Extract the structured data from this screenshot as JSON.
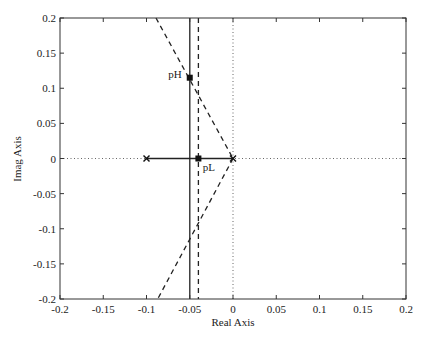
{
  "chart_data": {
    "type": "line",
    "subtype": "root-locus",
    "title": "",
    "xlabel": "Real  Axis",
    "ylabel": "Imag  Axis",
    "xlim": [
      -0.2,
      0.2
    ],
    "ylim": [
      -0.2,
      0.2
    ],
    "xticks": [
      -0.2,
      -0.15,
      -0.1,
      -0.05,
      0,
      0.05,
      0.1,
      0.15,
      0.2
    ],
    "xtick_labels": [
      "-0.2",
      "-0.15",
      "-0.1",
      "-0.05",
      "0",
      "0.05",
      "0.1",
      "0.15",
      "0.2"
    ],
    "yticks": [
      0.2,
      0.15,
      0.1,
      0.05,
      0,
      -0.05,
      -0.1,
      -0.15,
      -0.2
    ],
    "ytick_labels": [
      "0.2",
      "0.15",
      "0.1",
      "0.05",
      "0",
      "-0.05",
      "-0.1",
      "-0.15",
      "-0.2"
    ],
    "grid": false,
    "legend": null,
    "series": [
      {
        "name": "real-axis-locus",
        "style": "solid",
        "x": [
          -0.1,
          0
        ],
        "y": [
          0,
          0
        ]
      },
      {
        "name": "vertical-solid-locus",
        "style": "solid",
        "x": [
          -0.05,
          -0.05
        ],
        "y": [
          0.2,
          -0.2
        ]
      },
      {
        "name": "vertical-dashed-locus",
        "style": "dashed",
        "x": [
          -0.04,
          -0.04
        ],
        "y": [
          0.2,
          -0.2
        ]
      },
      {
        "name": "upper-dashed-asymptote",
        "style": "dashed",
        "x": [
          -0.089,
          0
        ],
        "y": [
          0.2,
          0
        ]
      },
      {
        "name": "lower-dashed-asymptote",
        "style": "dashed",
        "x": [
          0,
          -0.087
        ],
        "y": [
          0,
          -0.2
        ]
      },
      {
        "name": "real-axis-reference",
        "style": "dotted",
        "x": [
          -0.2,
          0.2
        ],
        "y": [
          0,
          0
        ]
      },
      {
        "name": "imag-axis-reference",
        "style": "dotted",
        "x": [
          0,
          0
        ],
        "y": [
          0.2,
          -0.2
        ]
      }
    ],
    "markers": [
      {
        "name": "pole-left",
        "symbol": "x",
        "x": -0.1,
        "y": 0
      },
      {
        "name": "pole-origin",
        "symbol": "x",
        "x": 0,
        "y": 0
      },
      {
        "name": "pL",
        "symbol": "square",
        "x": -0.04,
        "y": 0
      },
      {
        "name": "pH",
        "symbol": "square",
        "x": -0.05,
        "y": 0.115
      }
    ],
    "annotations": [
      {
        "text": "pH",
        "x": -0.075,
        "y": 0.12
      },
      {
        "text": "pL",
        "x": -0.035,
        "y": -0.012
      }
    ]
  },
  "labels": {
    "xlabel": "Real  Axis",
    "ylabel": "Imag  Axis",
    "pH": "pH",
    "pL": "pL"
  }
}
